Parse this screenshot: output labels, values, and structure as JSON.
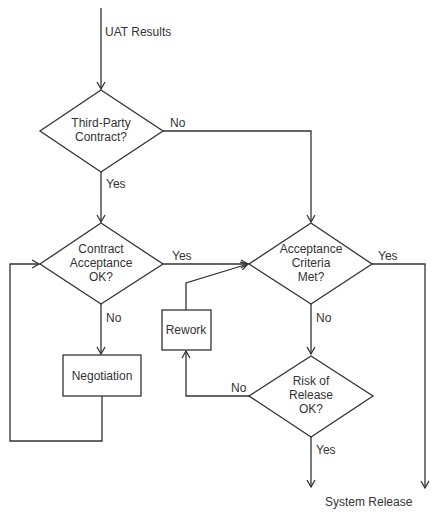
{
  "diagram": {
    "type": "flowchart",
    "colors": {
      "line": "#333333",
      "text": "#333333",
      "background": "#ffffff"
    },
    "input_label": "UAT Results",
    "output_label": "System Release",
    "nodes": {
      "third_party": {
        "shape": "decision",
        "line1": "Third-Party",
        "line2": "Contract?"
      },
      "contract_acceptance": {
        "shape": "decision",
        "line1": "Contract",
        "line2": "Acceptance",
        "line3": "OK?"
      },
      "negotiation": {
        "shape": "process",
        "label": "Negotiation"
      },
      "acceptance_criteria": {
        "shape": "decision",
        "line1": "Acceptance",
        "line2": "Criteria",
        "line3": "Met?"
      },
      "rework": {
        "shape": "process",
        "label": "Rework"
      },
      "risk_of_release": {
        "shape": "decision",
        "line1": "Risk of",
        "line2": "Release",
        "line3": "OK?"
      }
    },
    "edges": {
      "third_party_no": "No",
      "third_party_yes": "Yes",
      "contract_yes": "Yes",
      "contract_no": "No",
      "criteria_yes": "Yes",
      "criteria_no": "No",
      "risk_no": "No",
      "risk_yes": "Yes"
    }
  }
}
